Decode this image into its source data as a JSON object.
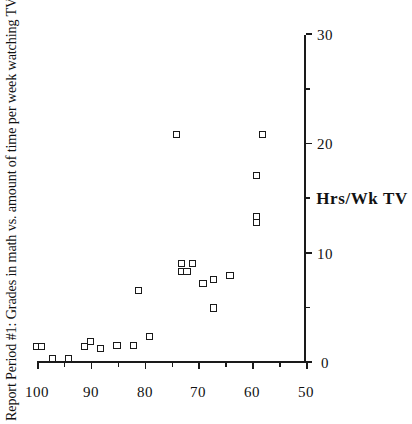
{
  "chart_data": {
    "type": "scatter",
    "title": "Report Period #1: Grades in math vs. amount of time per week watching TV.",
    "orientation": "rotated-90-ccw",
    "xlabel": "Hrs/Wk TV",
    "ylabel": "",
    "xlim": [
      0,
      30
    ],
    "ylim": [
      50,
      100
    ],
    "y_axis_inverted": true,
    "grid": false,
    "legend": null,
    "x_ticks": [
      0,
      10,
      20,
      30
    ],
    "x_ticks_minor": [
      5,
      15,
      25
    ],
    "x_tick_labels": [
      "0",
      "10",
      "20",
      "30"
    ],
    "y_ticks": [
      100,
      90,
      80,
      70,
      60,
      50
    ],
    "y_ticks_minor": [
      95,
      85,
      75,
      65,
      55
    ],
    "y_tick_labels": [
      "100",
      "90",
      "80",
      "70",
      "60",
      "50"
    ],
    "marker_style": "open-square",
    "marker_color": "#1a1a1a",
    "points": [
      {
        "x": 1.6,
        "y": 100
      },
      {
        "x": 1.6,
        "y": 99
      },
      {
        "x": 0.5,
        "y": 97
      },
      {
        "x": 0.5,
        "y": 94
      },
      {
        "x": 1.6,
        "y": 91
      },
      {
        "x": 2.0,
        "y": 90
      },
      {
        "x": 1.4,
        "y": 88
      },
      {
        "x": 1.7,
        "y": 85
      },
      {
        "x": 6.7,
        "y": 81
      },
      {
        "x": 1.7,
        "y": 82
      },
      {
        "x": 2.5,
        "y": 79
      },
      {
        "x": 9.2,
        "y": 73
      },
      {
        "x": 8.4,
        "y": 73
      },
      {
        "x": 8.4,
        "y": 72
      },
      {
        "x": 9.2,
        "y": 71
      },
      {
        "x": 7.3,
        "y": 69
      },
      {
        "x": 7.7,
        "y": 67
      },
      {
        "x": 5.1,
        "y": 67
      },
      {
        "x": 8.1,
        "y": 64
      },
      {
        "x": 21.0,
        "y": 74
      },
      {
        "x": 13.5,
        "y": 59
      },
      {
        "x": 12.9,
        "y": 59
      },
      {
        "x": 17.2,
        "y": 59
      },
      {
        "x": 21.0,
        "y": 58
      }
    ]
  }
}
